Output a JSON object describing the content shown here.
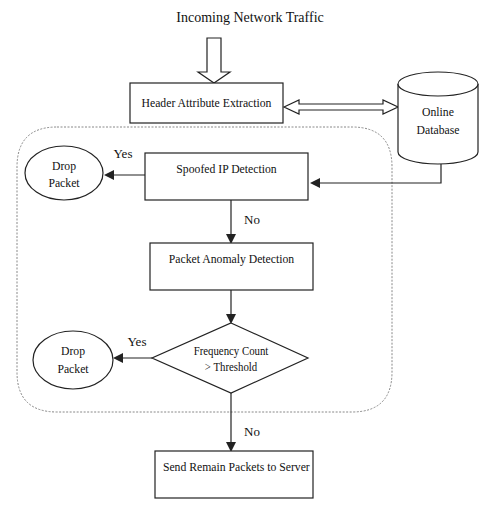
{
  "diagram": {
    "title": "Incoming Network Traffic",
    "nodes": {
      "header_extraction": "Header Attribute Extraction",
      "database_line1": "Online",
      "database_line2": "Database",
      "spoofed_ip": "Spoofed IP Detection",
      "drop1_line1": "Drop",
      "drop1_line2": "Packet",
      "anomaly": "Packet Anomaly Detection",
      "decision_line1": "Frequency Count",
      "decision_line2": "> Threshold",
      "drop2_line1": "Drop",
      "drop2_line2": "Packet",
      "send": "Send Remain Packets to Server"
    },
    "edges": {
      "spoofed_yes": "Yes",
      "spoofed_no": "No",
      "decision_yes": "Yes",
      "decision_no": "No"
    },
    "colors": {
      "stroke": "#222222",
      "container": "#888888",
      "background": "#ffffff"
    }
  }
}
